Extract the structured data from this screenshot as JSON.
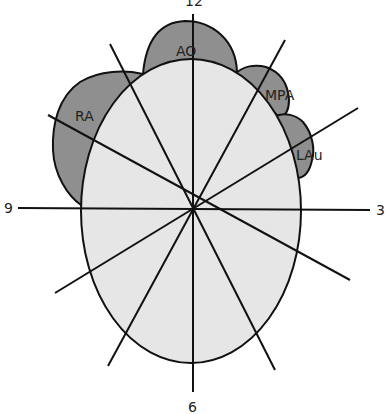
{
  "diagram": {
    "type": "heart-chest-xray-clock-diagram",
    "colors": {
      "structure_fill": "#8f8f8f",
      "heart_fill": "#e6e6e6",
      "stroke": "#111111",
      "background": "#ffffff"
    },
    "clock_labels": {
      "top": "12",
      "right": "3",
      "bottom": "6",
      "left": "9"
    },
    "structures": [
      {
        "id": "ao",
        "label": "AO"
      },
      {
        "id": "mpa",
        "label": "MPA"
      },
      {
        "id": "lau",
        "label": "LAu"
      },
      {
        "id": "ra",
        "label": "RA"
      }
    ]
  }
}
